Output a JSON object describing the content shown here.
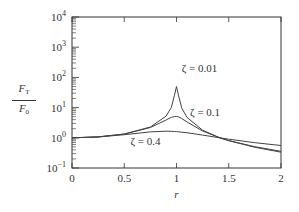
{
  "chart_data": {
    "type": "line",
    "title": "",
    "xlabel": "r",
    "ylabel": "F_T / F_0",
    "ylabel_parts": {
      "numerator": "F",
      "numerator_sub": "T",
      "denominator": "F",
      "denominator_sub": "0"
    },
    "xlim": [
      0,
      2
    ],
    "ylim": [
      0.1,
      10000
    ],
    "yscale": "log",
    "grid": false,
    "legend": "inline annotations",
    "x_ticks": [
      {
        "value": 0,
        "label": "0"
      },
      {
        "value": 0.5,
        "label": "0.5"
      },
      {
        "value": 1,
        "label": "1"
      },
      {
        "value": 1.5,
        "label": "1.5"
      },
      {
        "value": 2,
        "label": "2"
      }
    ],
    "y_ticks": [
      {
        "exp": 4,
        "label_base": "10",
        "label_exp": "4"
      },
      {
        "exp": 3,
        "label_base": "10",
        "label_exp": "3"
      },
      {
        "exp": 2,
        "label_base": "10",
        "label_exp": "2"
      },
      {
        "exp": 1,
        "label_base": "10",
        "label_exp": "1"
      },
      {
        "exp": 0,
        "label_base": "10",
        "label_exp": "0"
      },
      {
        "exp": -1,
        "label_base": "10",
        "label_exp": "−1"
      }
    ],
    "x": [
      0,
      0.25,
      0.5,
      0.75,
      0.9,
      0.95,
      0.98,
      1.0,
      1.02,
      1.05,
      1.1,
      1.25,
      1.414,
      1.5,
      1.75,
      2.0
    ],
    "series": [
      {
        "name": "ζ = 0.01",
        "values": [
          1.0,
          1.067,
          1.333,
          2.286,
          5.24,
          10.06,
          24.9,
          50.0,
          24.4,
          9.74,
          4.76,
          1.78,
          1.0,
          0.8,
          0.485,
          0.333
        ]
      },
      {
        "name": "ζ = 0.1",
        "values": [
          1.0,
          1.067,
          1.33,
          2.19,
          3.88,
          4.77,
          5.0,
          5.1,
          4.95,
          4.37,
          3.37,
          1.675,
          1.0,
          0.81,
          0.507,
          0.356
        ]
      },
      {
        "name": "ζ = 0.4",
        "values": [
          1.0,
          1.063,
          1.267,
          1.57,
          1.655,
          1.639,
          1.62,
          1.6,
          1.58,
          1.53,
          1.473,
          1.233,
          1.0,
          0.901,
          0.69,
          0.555
        ]
      }
    ],
    "annotations": [
      {
        "text": "ζ = 0.01",
        "x": 1.05,
        "y": 200
      },
      {
        "text": "ζ = 0.1",
        "x": 1.13,
        "y": 7
      },
      {
        "text": "ζ = 0.4",
        "x": 0.56,
        "y": 0.8
      }
    ]
  },
  "colors": {
    "axes": "#333333",
    "curve": "#444444",
    "background": "#ffffff"
  }
}
